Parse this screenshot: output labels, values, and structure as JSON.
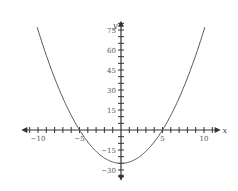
{
  "chart_data": {
    "type": "line",
    "title": "",
    "xlabel": "x",
    "ylabel": "y",
    "function": "y = x^2 - 25",
    "xlim": [
      -12,
      12
    ],
    "ylim": [
      -38,
      82
    ],
    "grid": false,
    "legend": null,
    "x_ticks": {
      "minor_step": 1,
      "labels": [
        -10,
        -5,
        5,
        10
      ]
    },
    "y_ticks": {
      "minor_step": 5,
      "labels": [
        -30,
        -15,
        15,
        30,
        45,
        60,
        75
      ]
    },
    "series": [
      {
        "name": "parabola",
        "x": [
          -10,
          -8,
          -6,
          -5,
          -4,
          -2,
          0,
          2,
          4,
          5,
          6,
          8,
          10
        ],
        "values": [
          75,
          39,
          11,
          0,
          -9,
          -21,
          -25,
          -21,
          -9,
          0,
          11,
          39,
          75
        ]
      }
    ],
    "annotations": {
      "vertex": [
        0,
        -25
      ],
      "roots": [
        -5,
        5
      ]
    }
  },
  "colors": {
    "axis": "#333333",
    "curve": "#555555",
    "background": "#ffffff"
  }
}
